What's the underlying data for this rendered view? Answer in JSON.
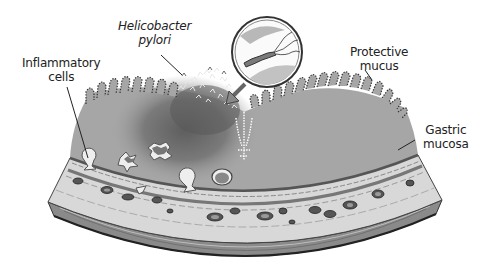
{
  "figure": {
    "labels": [
      {
        "id": "h-pylori",
        "line1": "Helicobacter",
        "line2": "pylori",
        "italic": true
      },
      {
        "id": "inflammatory-cells",
        "line1": "Inflammatory",
        "line2": "cells",
        "italic": false
      },
      {
        "id": "protective-mucus",
        "line1": "Protective",
        "line2": "mucus",
        "italic": false
      },
      {
        "id": "gastric-mucosa",
        "line1": "Gastric",
        "line2": "mucosa",
        "italic": false
      }
    ],
    "inset": {
      "depicts": "magnified H. pylori bacterium with flagella"
    },
    "colors": {
      "mucosa": "#a6a6a6",
      "inflamed_zone": "#6f6f6f",
      "outline": "#333333",
      "background": "#ffffff",
      "submucosa": "#d4d4d4",
      "muscle": "#8a8a8a"
    }
  }
}
